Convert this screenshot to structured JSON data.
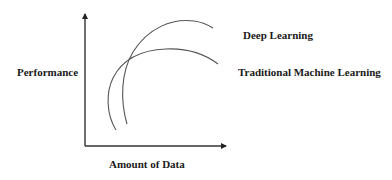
{
  "diagram": {
    "type": "conceptual-line-chart",
    "axes": {
      "y_label": "Performance",
      "x_label": "Amount of Data"
    },
    "series": [
      {
        "name": "Deep Learning",
        "label": "Deep Learning",
        "description": "Curve rising steeply and reaching the higher performance plateau"
      },
      {
        "name": "Traditional Machine Learning",
        "label": "Traditional Machine Learning",
        "description": "Curve rising earlier but plateauing at lower performance"
      }
    ],
    "colors": {
      "axis": "#222222",
      "curve": "#555555",
      "text": "#1a1a1a",
      "background": "#ffffff"
    }
  }
}
